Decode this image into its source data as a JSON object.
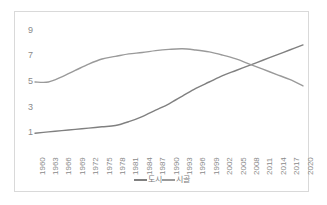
{
  "chart_data": {
    "type": "line",
    "title": "",
    "xlabel": "",
    "ylabel": "",
    "grid": false,
    "legend_position": "bottom-center",
    "ylim": [
      0,
      10
    ],
    "y_ticks": [
      9,
      7,
      5,
      3,
      1
    ],
    "categories": [
      "1960",
      "1963",
      "1966",
      "1969",
      "1972",
      "1975",
      "1978",
      "1981",
      "1984",
      "1987",
      "1990",
      "1993",
      "1996",
      "1999",
      "2002",
      "2005",
      "2008",
      "2011",
      "2014",
      "2017",
      "2020"
    ],
    "series": [
      {
        "name": "도시",
        "color": "#808080",
        "values": [
          1.0,
          1.1,
          1.2,
          1.3,
          1.4,
          1.5,
          1.6,
          1.9,
          2.3,
          2.8,
          3.3,
          3.9,
          4.5,
          5.0,
          5.5,
          5.9,
          6.3,
          6.7,
          7.1,
          7.5,
          7.9
        ]
      },
      {
        "name": "시골",
        "color": "#9a9a9a",
        "values": [
          5.0,
          5.0,
          5.4,
          5.9,
          6.4,
          6.8,
          7.0,
          7.2,
          7.3,
          7.45,
          7.55,
          7.6,
          7.5,
          7.35,
          7.1,
          6.8,
          6.4,
          6.0,
          5.6,
          5.2,
          4.7
        ]
      }
    ]
  },
  "legend": {
    "entries": [
      {
        "label": "도시"
      },
      {
        "label": "시골"
      }
    ]
  }
}
